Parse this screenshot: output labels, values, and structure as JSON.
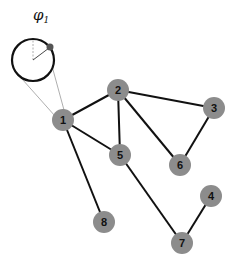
{
  "diagram": {
    "type": "graph",
    "colors": {
      "node_fill": "#8c8c8c",
      "edge": "#111111",
      "label": "#111111",
      "guide": "#999999",
      "background": "#ffffff"
    },
    "phase_indicator": {
      "label_symbol": "φ",
      "label_subscript": "1",
      "attached_to_node": "1",
      "circle": {
        "cx": 33,
        "cy": 60,
        "r": 21
      },
      "marker": {
        "x": 50,
        "y": 48
      }
    },
    "nodes": [
      {
        "id": "1",
        "label": "1",
        "x": 63,
        "y": 120
      },
      {
        "id": "2",
        "label": "2",
        "x": 118,
        "y": 90
      },
      {
        "id": "3",
        "label": "3",
        "x": 214,
        "y": 108
      },
      {
        "id": "4",
        "label": "4",
        "x": 211,
        "y": 196
      },
      {
        "id": "5",
        "label": "5",
        "x": 120,
        "y": 155
      },
      {
        "id": "6",
        "label": "6",
        "x": 180,
        "y": 165
      },
      {
        "id": "7",
        "label": "7",
        "x": 182,
        "y": 243
      },
      {
        "id": "8",
        "label": "8",
        "x": 104,
        "y": 222
      }
    ],
    "edges": [
      [
        "1",
        "2"
      ],
      [
        "1",
        "5"
      ],
      [
        "1",
        "8"
      ],
      [
        "2",
        "5"
      ],
      [
        "2",
        "3"
      ],
      [
        "2",
        "6"
      ],
      [
        "3",
        "6"
      ],
      [
        "5",
        "7"
      ],
      [
        "4",
        "7"
      ]
    ]
  }
}
